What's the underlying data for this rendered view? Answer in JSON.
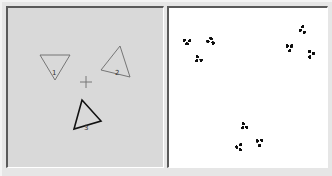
{
  "editor": {
    "background": "#d9d9d9",
    "center_marker": {
      "x": 86,
      "y": 82,
      "symbol": "+"
    },
    "triangles": [
      {
        "label": "1",
        "points": [
          [
            40,
            55
          ],
          [
            70,
            55
          ],
          [
            55,
            80
          ]
        ],
        "label_pos": [
          54,
          72
        ],
        "selected": false
      },
      {
        "label": "2",
        "points": [
          [
            120,
            46
          ],
          [
            130,
            77
          ],
          [
            101,
            70
          ]
        ],
        "label_pos": [
          117,
          72
        ],
        "selected": false
      },
      {
        "label": "3",
        "points": [
          [
            82,
            100
          ],
          [
            101,
            121
          ],
          [
            74,
            129
          ]
        ],
        "label_pos": [
          86,
          127
        ],
        "selected": true
      }
    ]
  },
  "render": {
    "background": "#ffffff",
    "fractal_color": "#111111",
    "description": "IFS fractal attractor generated by the three triangle maps"
  },
  "colors": {
    "unselected_stroke": "#6a6a6a",
    "selected_stroke": "#111111"
  }
}
